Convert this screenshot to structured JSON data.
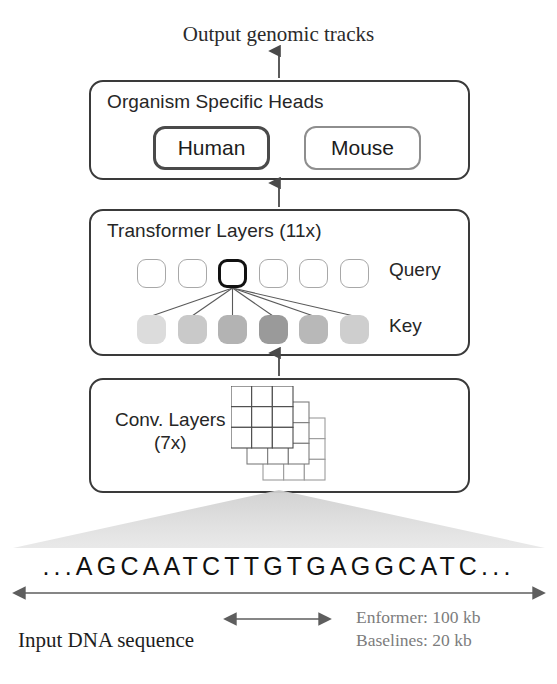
{
  "figure": {
    "output_label": "Output genomic tracks",
    "input_label": "Input DNA sequence",
    "dna_sequence": "...AGCAATCTTGTGAGGCATC..."
  },
  "heads": {
    "title": "Organism Specific Heads",
    "items": [
      {
        "label": "Human",
        "highlighted": true
      },
      {
        "label": "Mouse",
        "highlighted": false
      }
    ]
  },
  "transformer": {
    "title": "Transformer Layers (11x)",
    "query_label": "Query",
    "key_label": "Key",
    "query_cells": [
      {
        "highlighted": false
      },
      {
        "highlighted": false
      },
      {
        "highlighted": true
      },
      {
        "highlighted": false
      },
      {
        "highlighted": false
      },
      {
        "highlighted": false
      }
    ],
    "key_cells": [
      {
        "shade": "#dcdcdc"
      },
      {
        "shade": "#c9c9c9"
      },
      {
        "shade": "#b3b3b3"
      },
      {
        "shade": "#9a9a9a"
      },
      {
        "shade": "#b8b8b8"
      },
      {
        "shade": "#cecece"
      }
    ]
  },
  "conv": {
    "title_line1": "Conv. Layers",
    "title_line2": "(7x)",
    "grid_rows": 3,
    "grid_cols": 3,
    "grid_count": 3
  },
  "scale": {
    "lines": [
      "Enformer: 100 kb",
      "Baselines: 20 kb"
    ]
  },
  "colors": {
    "box_border": "#3a3a3a",
    "highlight_border": "#111111",
    "muted_border": "#8e8e8e",
    "funnel_fill": "#d9d9d9",
    "arrow": "#555555",
    "legend_text": "#7c7c7c"
  }
}
